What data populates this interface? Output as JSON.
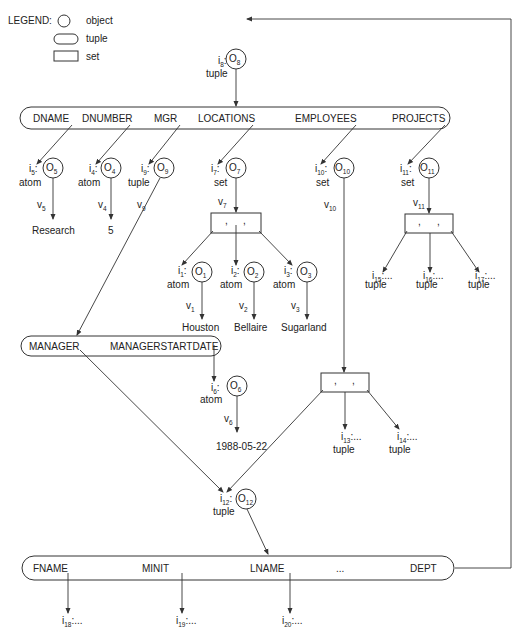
{
  "legend": {
    "title": "LEGEND:",
    "items": [
      {
        "shape": "circle",
        "label": "object"
      },
      {
        "shape": "rounded-rect",
        "label": "tuple"
      },
      {
        "shape": "rect",
        "label": "set"
      }
    ]
  },
  "root": {
    "id": "i",
    "id_sub": "8",
    "obj": "O",
    "obj_sub": "8",
    "type": "tuple"
  },
  "department_tuple": {
    "attributes": [
      "DNAME",
      "DNUMBER",
      "MGR",
      "LOCATIONS",
      "EMPLOYEES",
      "PROJECTS"
    ]
  },
  "objects": {
    "o5": {
      "id": "i",
      "id_sub": "5",
      "obj": "O",
      "obj_sub": "5",
      "type": "atom",
      "v": "v",
      "v_sub": "5",
      "value": "Research"
    },
    "o4": {
      "id": "i",
      "id_sub": "4",
      "obj": "O",
      "obj_sub": "4",
      "type": "atom",
      "v": "v",
      "v_sub": "4",
      "value": "5"
    },
    "o9": {
      "id": "i",
      "id_sub": "9",
      "obj": "O",
      "obj_sub": "9",
      "type": "tuple",
      "v": "v",
      "v_sub": "9"
    },
    "o7": {
      "id": "i",
      "id_sub": "7",
      "obj": "O",
      "obj_sub": "7",
      "type": "set",
      "v": "v",
      "v_sub": "7"
    },
    "o10": {
      "id": "i",
      "id_sub": "10",
      "obj": "O",
      "obj_sub": "10",
      "type": "set",
      "v": "v",
      "v_sub": "10"
    },
    "o11": {
      "id": "i",
      "id_sub": "11",
      "obj": "O",
      "obj_sub": "11",
      "type": "set",
      "v": "v",
      "v_sub": "11"
    },
    "o1": {
      "id": "i",
      "id_sub": "1",
      "obj": "O",
      "obj_sub": "1",
      "type": "atom",
      "v": "v",
      "v_sub": "1",
      "value": "Houston"
    },
    "o2": {
      "id": "i",
      "id_sub": "2",
      "obj": "O",
      "obj_sub": "2",
      "type": "atom",
      "v": "v",
      "v_sub": "2",
      "value": "Bellaire"
    },
    "o3": {
      "id": "i",
      "id_sub": "3",
      "obj": "O",
      "obj_sub": "3",
      "type": "atom",
      "v": "v",
      "v_sub": "3",
      "value": "Sugarland"
    },
    "o6": {
      "id": "i",
      "id_sub": "6",
      "obj": "O",
      "obj_sub": "6",
      "type": "atom",
      "v": "v",
      "v_sub": "6",
      "value": "1988-05-22"
    },
    "o12": {
      "id": "i",
      "id_sub": "12",
      "obj": "O",
      "obj_sub": "12",
      "type": "tuple"
    }
  },
  "set_separator": ",",
  "refs": {
    "i15": {
      "id": "i",
      "id_sub": "15",
      "rest": ":...",
      "type": "tuple"
    },
    "i16": {
      "id": "i",
      "id_sub": "16",
      "rest": ":...",
      "type": "tuple"
    },
    "i17": {
      "id": "i",
      "id_sub": "17",
      "rest": ":...",
      "type": "tuple"
    },
    "i13": {
      "id": "i",
      "id_sub": "13",
      "rest": ":...",
      "type": "tuple"
    },
    "i14": {
      "id": "i",
      "id_sub": "14",
      "rest": ":...",
      "type": "tuple"
    },
    "i18": {
      "id": "i",
      "id_sub": "18",
      "rest": ":..."
    },
    "i19": {
      "id": "i",
      "id_sub": "19",
      "rest": ":..."
    },
    "i20": {
      "id": "i",
      "id_sub": "20",
      "rest": ":..."
    }
  },
  "colon": ":",
  "manager_tuple": {
    "attributes": [
      "MANAGER",
      "MANAGERSTARTDATE"
    ]
  },
  "employee_tuple": {
    "attributes": [
      "FNAME",
      "MINIT",
      "LNAME",
      "...",
      "DEPT"
    ]
  }
}
